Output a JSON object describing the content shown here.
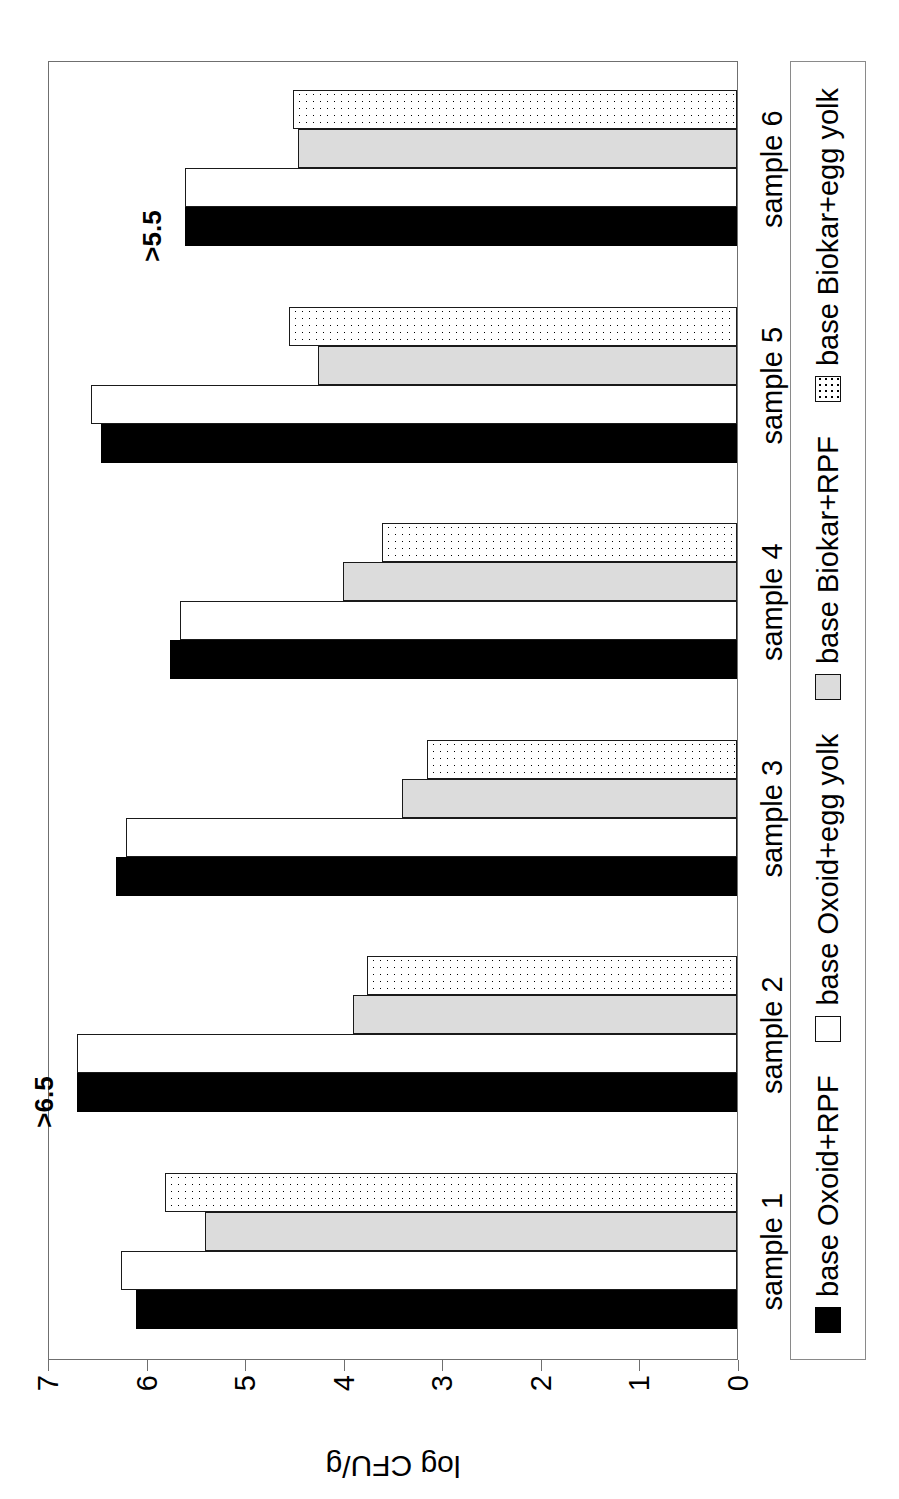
{
  "chart_data": {
    "type": "bar",
    "orientation": "horizontal-grouped",
    "title": "",
    "xlabel": "",
    "ylabel": "log CFU/g",
    "ylim": [
      0,
      7
    ],
    "ytick_labels": [
      "0",
      "1",
      "2",
      "3",
      "4",
      "5",
      "6",
      "7"
    ],
    "grid": false,
    "legend_position": "bottom",
    "categories": [
      "sample 1",
      "sample 2",
      "sample 3",
      "sample 4",
      "sample 5",
      "sample 6"
    ],
    "series": [
      {
        "name": "base Oxoid+RPF",
        "swatch": "s-black",
        "color": "#000000",
        "values": [
          6.1,
          6.7,
          6.3,
          5.75,
          6.45,
          5.6
        ]
      },
      {
        "name": "base Oxoid+egg yolk",
        "swatch": "s-white",
        "color": "#ffffff",
        "values": [
          6.25,
          6.7,
          6.2,
          5.65,
          6.55,
          5.6
        ]
      },
      {
        "name": "base Biokar+RPF",
        "swatch": "s-gray",
        "color": "#dcdcdc",
        "values": [
          5.4,
          3.9,
          3.4,
          4.0,
          4.25,
          4.45
        ]
      },
      {
        "name": "base Biokar+egg yolk",
        "swatch": "s-dot",
        "color": "#ffffff",
        "values": [
          5.8,
          3.75,
          3.15,
          3.6,
          4.55,
          4.5
        ]
      }
    ],
    "annotations": [
      {
        "text": ">6.5",
        "category": "sample 2",
        "series": "base Oxoid+RPF"
      },
      {
        "text": ">5.5",
        "category": "sample 6",
        "series": "base Oxoid+RPF"
      }
    ]
  },
  "legend": {
    "items": [
      {
        "label": "base Oxoid+RPF",
        "swatch": "s-black"
      },
      {
        "label": "base Oxoid+egg yolk",
        "swatch": "s-white"
      },
      {
        "label": "base Biokar+RPF",
        "swatch": "s-gray"
      },
      {
        "label": "base Biokar+egg yolk",
        "swatch": "s-dot"
      }
    ]
  }
}
